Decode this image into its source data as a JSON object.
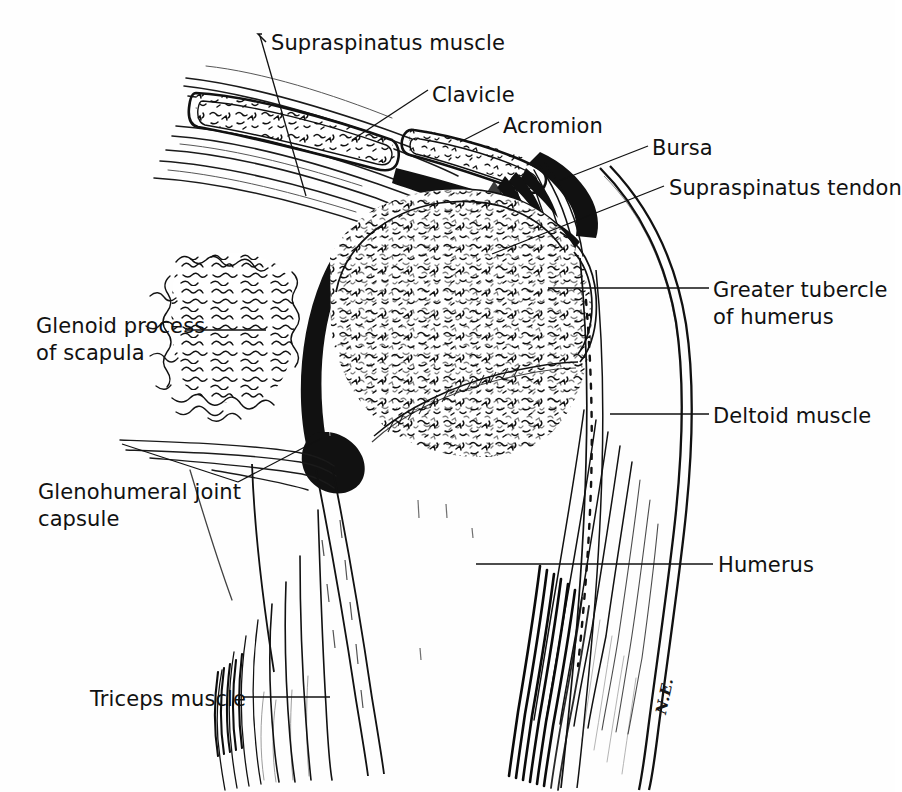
{
  "figure": {
    "style": "pen-and-ink anatomical line drawing",
    "background_color": "#fefefe",
    "ink_color": "#111111",
    "signature": "N.E."
  },
  "labels": [
    {
      "id": "supraspinatus-muscle",
      "text": "Supraspinatus muscle",
      "x": 271,
      "y": 30,
      "align": "left"
    },
    {
      "id": "clavicle",
      "text": "Clavicle",
      "x": 432,
      "y": 82,
      "align": "left"
    },
    {
      "id": "acromion",
      "text": "Acromion",
      "x": 503,
      "y": 113,
      "align": "left"
    },
    {
      "id": "bursa",
      "text": "Bursa",
      "x": 652,
      "y": 135,
      "align": "left"
    },
    {
      "id": "supraspinatus-tendon",
      "text": "Supraspinatus tendon",
      "x": 669,
      "y": 175,
      "align": "left"
    },
    {
      "id": "greater-tubercle",
      "text": "Greater tubercle\nof humerus",
      "x": 713,
      "y": 277,
      "align": "left"
    },
    {
      "id": "deltoid-muscle",
      "text": "Deltoid muscle",
      "x": 713,
      "y": 403,
      "align": "left"
    },
    {
      "id": "humerus",
      "text": "Humerus",
      "x": 718,
      "y": 552,
      "align": "left"
    },
    {
      "id": "glenoid-process",
      "text": "Glenoid process\nof scapula",
      "x": 36,
      "y": 313,
      "align": "left"
    },
    {
      "id": "glenohumeral-capsule",
      "text": "Glenohumeral joint\ncapsule",
      "x": 38,
      "y": 479,
      "align": "left"
    },
    {
      "id": "triceps-muscle",
      "text": "Triceps muscle",
      "x": 90,
      "y": 686,
      "align": "left"
    }
  ],
  "anatomy_structures": [
    "Supraspinatus muscle belly",
    "Clavicle (cut end, cancellous bone)",
    "Acromion (cut end, cancellous bone)",
    "Subacromial bursa",
    "Supraspinatus tendon fibers",
    "Humeral head with cancellous bone stippling",
    "Greater tubercle of humerus",
    "Glenoid process of scapula",
    "Glenohumeral joint capsule",
    "Deltoid muscle",
    "Humerus shaft",
    "Triceps muscle"
  ]
}
